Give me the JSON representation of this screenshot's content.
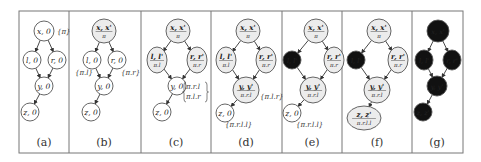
{
  "figure": {
    "frame": {
      "x": 19,
      "y": 11,
      "w": 444,
      "h": 142,
      "stroke": "#777777"
    },
    "dividers_x": [
      69,
      141,
      211,
      282,
      342,
      412
    ],
    "colors": {
      "node_stroke": "#555555",
      "node_fill_plain": "#ffffff",
      "node_fill_shaded": "#ececec",
      "node_fill_black": "#111111",
      "subtext": "#8a8a8a",
      "edge": "#333333"
    },
    "panels": [
      {
        "id": "a",
        "caption": "(a)",
        "cx": 44,
        "nodes": [
          {
            "id": "x",
            "label": "x, 0",
            "style": "plain",
            "x": 44,
            "y": 31,
            "rx": 10,
            "ry": 10
          },
          {
            "id": "l",
            "label": "l, 0",
            "style": "plain",
            "x": 32,
            "y": 60,
            "rx": 9,
            "ry": 9
          },
          {
            "id": "r",
            "label": "r, 0",
            "style": "plain",
            "x": 57,
            "y": 60,
            "rx": 9,
            "ry": 9
          },
          {
            "id": "y",
            "label": "y, 0",
            "style": "plain",
            "x": 44,
            "y": 86,
            "rx": 9,
            "ry": 9
          },
          {
            "id": "z",
            "label": "z, 0",
            "style": "plain",
            "x": 30,
            "y": 112,
            "rx": 9,
            "ry": 9
          }
        ],
        "annotations": [
          {
            "text": "{π}",
            "x": 57,
            "y": 34
          }
        ]
      },
      {
        "id": "b",
        "caption": "(b)",
        "cx": 104,
        "nodes": [
          {
            "id": "x",
            "label": "x, x'",
            "sub": "π",
            "style": "shaded",
            "x": 104,
            "y": 31,
            "rx": 12,
            "ry": 12
          },
          {
            "id": "l",
            "label": "l, 0",
            "style": "plain",
            "x": 92,
            "y": 60,
            "rx": 9,
            "ry": 9
          },
          {
            "id": "r",
            "label": "r, 0",
            "style": "plain",
            "x": 117,
            "y": 60,
            "rx": 9,
            "ry": 9
          },
          {
            "id": "y",
            "label": "y, 0",
            "style": "plain",
            "x": 104,
            "y": 86,
            "rx": 9,
            "ry": 9
          },
          {
            "id": "z",
            "label": "z, 0",
            "style": "plain",
            "x": 91,
            "y": 112,
            "rx": 9,
            "ry": 9
          }
        ],
        "annotations": [
          {
            "text": "{π.l}",
            "x": 75,
            "y": 75
          },
          {
            "text": "{π.r}",
            "x": 121,
            "y": 75
          }
        ]
      },
      {
        "id": "c",
        "caption": "(c)",
        "cx": 176,
        "nodes": [
          {
            "id": "x",
            "label": "x, x'",
            "sub": "π",
            "style": "shaded",
            "x": 178,
            "y": 31,
            "rx": 12,
            "ry": 12
          },
          {
            "id": "l",
            "label": "l, l'",
            "sub": "π.l",
            "style": "shaded",
            "x": 157,
            "y": 60,
            "rx": 10,
            "ry": 13
          },
          {
            "id": "r",
            "label": "r, r'",
            "sub": "π.r",
            "style": "shaded",
            "x": 197,
            "y": 60,
            "rx": 10,
            "ry": 13
          },
          {
            "id": "y",
            "label": "y, 0",
            "style": "plain",
            "x": 177,
            "y": 86,
            "rx": 9,
            "ry": 9
          },
          {
            "id": "z",
            "label": "z, 0",
            "style": "plain",
            "x": 162,
            "y": 112,
            "rx": 9,
            "ry": 9
          }
        ],
        "annotations": [
          {
            "text": "π.r.l",
            "x": 186,
            "y": 89
          },
          {
            "text": "π.l.r",
            "x": 186,
            "y": 99
          }
        ],
        "brace": {
          "x": 184,
          "y1": 82,
          "y2": 102
        }
      },
      {
        "id": "d",
        "caption": "(d)",
        "cx": 246,
        "nodes": [
          {
            "id": "x",
            "label": "x, x'",
            "sub": "π",
            "style": "shaded",
            "x": 248,
            "y": 31,
            "rx": 12,
            "ry": 12
          },
          {
            "id": "l",
            "label": "l, l'",
            "sub": "π.l",
            "style": "shaded",
            "x": 226,
            "y": 60,
            "rx": 10,
            "ry": 13
          },
          {
            "id": "r",
            "label": "r, r'",
            "sub": "π.r",
            "style": "shaded",
            "x": 266,
            "y": 60,
            "rx": 10,
            "ry": 13
          },
          {
            "id": "y",
            "label": "y, y'",
            "sub": "π.r.l",
            "style": "shaded",
            "x": 246,
            "y": 90,
            "rx": 13,
            "ry": 13
          },
          {
            "id": "z",
            "label": "z, 0",
            "style": "plain",
            "x": 225,
            "y": 113,
            "rx": 9,
            "ry": 9
          }
        ],
        "annotations": [
          {
            "text": "{π.l.r}",
            "x": 260,
            "y": 99
          },
          {
            "text": "{π.r.l.l}",
            "x": 225,
            "y": 127
          }
        ]
      },
      {
        "id": "e",
        "caption": "(e)",
        "cx": 312,
        "nodes": [
          {
            "id": "x",
            "label": "x, x'",
            "sub": "π",
            "style": "shaded",
            "x": 316,
            "y": 31,
            "rx": 12,
            "ry": 12
          },
          {
            "id": "l",
            "label": "l, l'",
            "style": "black",
            "x": 292,
            "y": 60,
            "rx": 9,
            "ry": 9
          },
          {
            "id": "r",
            "label": "r, r'",
            "sub": "π.r",
            "style": "shaded",
            "x": 334,
            "y": 60,
            "rx": 10,
            "ry": 13
          },
          {
            "id": "y",
            "label": "y, y'",
            "sub": "π.r.l",
            "style": "shaded",
            "x": 313,
            "y": 90,
            "rx": 13,
            "ry": 13
          },
          {
            "id": "z",
            "label": "z, 0",
            "style": "plain",
            "x": 292,
            "y": 113,
            "rx": 9,
            "ry": 9
          }
        ],
        "annotations": [
          {
            "text": "{π.r.l.l}",
            "x": 296,
            "y": 127
          }
        ]
      },
      {
        "id": "f",
        "caption": "(f)",
        "cx": 377,
        "nodes": [
          {
            "id": "x",
            "label": "x, x'",
            "sub": "π",
            "style": "shaded",
            "x": 379,
            "y": 31,
            "rx": 12,
            "ry": 12
          },
          {
            "id": "l",
            "label": "l, l'",
            "style": "black",
            "x": 356,
            "y": 60,
            "rx": 9,
            "ry": 9
          },
          {
            "id": "r",
            "label": "r, r'",
            "sub": "π.r",
            "style": "shaded",
            "x": 398,
            "y": 60,
            "rx": 10,
            "ry": 13
          },
          {
            "id": "y",
            "label": "y, y'",
            "sub": "π.r.l",
            "style": "shaded",
            "x": 377,
            "y": 90,
            "rx": 13,
            "ry": 13
          },
          {
            "id": "z",
            "label": "z, z'",
            "sub": "π.r.l.l",
            "style": "shaded",
            "x": 364,
            "y": 118,
            "rx": 17,
            "ry": 12
          }
        ],
        "annotations": []
      },
      {
        "id": "g",
        "caption": "(g)",
        "cx": 437,
        "nodes": [
          {
            "id": "x",
            "label": "x, x'",
            "style": "black",
            "x": 438,
            "y": 31,
            "rx": 11,
            "ry": 11
          },
          {
            "id": "l",
            "label": "l, l'",
            "style": "black",
            "x": 424,
            "y": 60,
            "rx": 9,
            "ry": 10
          },
          {
            "id": "r",
            "label": "r, r'",
            "style": "black",
            "x": 452,
            "y": 60,
            "rx": 9,
            "ry": 10
          },
          {
            "id": "y",
            "label": "y, y'",
            "style": "black",
            "x": 437,
            "y": 86,
            "rx": 10,
            "ry": 10
          },
          {
            "id": "z",
            "label": "z, z'",
            "style": "black",
            "x": 423,
            "y": 112,
            "rx": 9,
            "ry": 9
          }
        ],
        "annotations": []
      }
    ],
    "edges": [
      [
        "x",
        "l"
      ],
      [
        "x",
        "r"
      ],
      [
        "l",
        "y"
      ],
      [
        "r",
        "y"
      ],
      [
        "y",
        "z"
      ]
    ]
  }
}
